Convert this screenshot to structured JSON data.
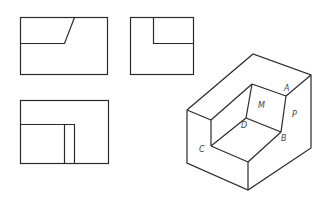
{
  "figure": {
    "type": "three-view orthographic projection with isometric drawing",
    "views": [
      {
        "name": "front-view",
        "description": "rectangle with stepped notch line in upper-left"
      },
      {
        "name": "left-view",
        "description": "rectangle with L-shaped inner line in upper-left"
      },
      {
        "name": "top-view",
        "description": "rectangle with inner L and two vertical lines"
      }
    ],
    "isometric": {
      "labels": {
        "A": "A",
        "B": "B",
        "C": "C",
        "D": "D",
        "M": "M",
        "P": "P"
      }
    },
    "colors": {
      "line": "#2a2a2a",
      "label": "#444444",
      "background": "#ffffff"
    }
  }
}
